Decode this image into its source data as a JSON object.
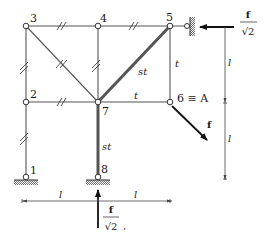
{
  "diagram": {
    "type": "plane truss structure",
    "nodes": [
      {
        "id": "1",
        "label": "1",
        "x": 26,
        "y": 176,
        "support": "pin"
      },
      {
        "id": "2",
        "label": "2",
        "x": 26,
        "y": 102
      },
      {
        "id": "3",
        "label": "3",
        "x": 26,
        "y": 26
      },
      {
        "id": "4",
        "label": "4",
        "x": 98,
        "y": 26
      },
      {
        "id": "5",
        "label": "5",
        "x": 170,
        "y": 26,
        "support": "roller-wall"
      },
      {
        "id": "6",
        "label": "6 ≡ A",
        "x": 170,
        "y": 102
      },
      {
        "id": "7",
        "label": "7",
        "x": 98,
        "y": 102
      },
      {
        "id": "8",
        "label": "8",
        "x": 98,
        "y": 176,
        "support": "pin"
      }
    ],
    "members": [
      {
        "from": "1",
        "to": "2",
        "mark": "//"
      },
      {
        "from": "2",
        "to": "3",
        "mark": "//"
      },
      {
        "from": "3",
        "to": "4",
        "mark": "//"
      },
      {
        "from": "4",
        "to": "5",
        "mark": "//"
      },
      {
        "from": "3",
        "to": "7",
        "mark": "//"
      },
      {
        "from": "4",
        "to": "7",
        "mark": "//"
      },
      {
        "from": "2",
        "to": "7",
        "mark": "//"
      },
      {
        "from": "5",
        "to": "7",
        "mark": "st",
        "thick": true
      },
      {
        "from": "5",
        "to": "6",
        "mark": "t"
      },
      {
        "from": "7",
        "to": "6",
        "mark": "t"
      },
      {
        "from": "7",
        "to": "8",
        "mark": "st",
        "thick": true
      }
    ],
    "member_labels": {
      "st_diag": "st",
      "st_vert": "st",
      "t_vert": "t",
      "t_horiz": "t"
    },
    "loads": [
      {
        "at": "5",
        "direction": "left",
        "label_num": "f",
        "label_den": "√2"
      },
      {
        "at": "6",
        "direction": "down-right",
        "label": "f"
      },
      {
        "at": "8",
        "direction": "up",
        "label_num": "f",
        "label_den": "√2"
      }
    ],
    "dimensions": {
      "horizontal": [
        "l",
        "l"
      ],
      "vertical": [
        "l",
        "l"
      ]
    },
    "trailing_mark": ","
  }
}
